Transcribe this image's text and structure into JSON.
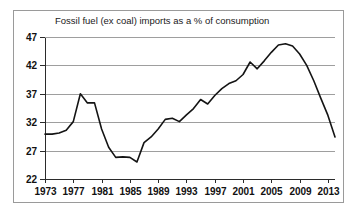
{
  "figure": {
    "border_color": "#9a9a9a",
    "background": "#ffffff"
  },
  "chart_data": {
    "type": "line",
    "title": "Fossil fuel (ex coal) imports as a % of consumption",
    "xlabel": "",
    "ylabel": "",
    "xlim": [
      1973,
      2014
    ],
    "ylim": [
      22,
      47
    ],
    "grid": true,
    "legend": false,
    "line_color": "#141414",
    "ytick_labels": [
      "47",
      "42",
      "37",
      "32",
      "27",
      "22"
    ],
    "yticks": [
      47,
      42,
      37,
      32,
      27,
      22
    ],
    "xtick_labels": [
      "1973",
      "1977",
      "1981",
      "1985",
      "1989",
      "1993",
      "1997",
      "2001",
      "2005",
      "2009",
      "2013"
    ],
    "xticks": [
      1973,
      1977,
      1981,
      1985,
      1989,
      1993,
      1997,
      2001,
      2005,
      2009,
      2013
    ],
    "x": [
      1973,
      1974,
      1975,
      1976,
      1977,
      1978,
      1979,
      1980,
      1981,
      1982,
      1983,
      1984,
      1985,
      1986,
      1987,
      1988,
      1989,
      1990,
      1991,
      1992,
      1993,
      1994,
      1995,
      1996,
      1997,
      1998,
      1999,
      2000,
      2001,
      2002,
      2003,
      2004,
      2005,
      2006,
      2007,
      2008,
      2009,
      2010,
      2011,
      2012,
      2013,
      2014
    ],
    "values": [
      29.9,
      29.9,
      30.1,
      30.6,
      32.1,
      37.0,
      35.4,
      35.4,
      30.8,
      27.6,
      25.8,
      25.9,
      25.8,
      25.0,
      28.4,
      29.4,
      30.8,
      32.5,
      32.7,
      32.1,
      33.3,
      34.4,
      36.0,
      35.2,
      36.7,
      37.9,
      38.8,
      39.3,
      40.4,
      42.6,
      41.4,
      42.8,
      44.3,
      45.6,
      45.8,
      45.4,
      44.0,
      42.0,
      39.3,
      36.2,
      33.2,
      29.4
    ],
    "series_name": "Fossil fuel (ex coal) imports as a % of consumption"
  }
}
